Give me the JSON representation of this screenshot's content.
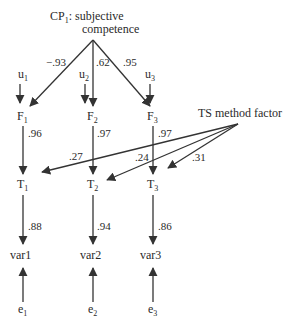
{
  "diagram": {
    "type": "path-model",
    "top_factor": {
      "name": "CP",
      "sub": "1",
      "line1_suffix": ": subjective",
      "line2": "competence"
    },
    "method_factor": {
      "label": "TS method factor"
    },
    "columns": [
      {
        "u": {
          "name": "u",
          "sub": "1"
        },
        "F": {
          "name": "F",
          "sub": "1"
        },
        "T": {
          "name": "T",
          "sub": "1"
        },
        "var": "var1",
        "e": {
          "name": "e",
          "sub": "1"
        },
        "cp_loading": "−.93",
        "f_to_t": ".96",
        "method_loading": ".27",
        "t_to_var": ".88"
      },
      {
        "u": {
          "name": "u",
          "sub": "2"
        },
        "F": {
          "name": "F",
          "sub": "2"
        },
        "T": {
          "name": "T",
          "sub": "2"
        },
        "var": "var2",
        "e": {
          "name": "e",
          "sub": "2"
        },
        "cp_loading": ".62",
        "f_to_t": ".97",
        "method_loading": ".24",
        "t_to_var": ".94"
      },
      {
        "u": {
          "name": "u",
          "sub": "3"
        },
        "F": {
          "name": "F",
          "sub": "3"
        },
        "T": {
          "name": "T",
          "sub": "3"
        },
        "var": "var3",
        "e": {
          "name": "e",
          "sub": "3"
        },
        "cp_loading": ".95",
        "f_to_t": ".97",
        "method_loading": ".31",
        "t_to_var": ".86"
      }
    ]
  }
}
